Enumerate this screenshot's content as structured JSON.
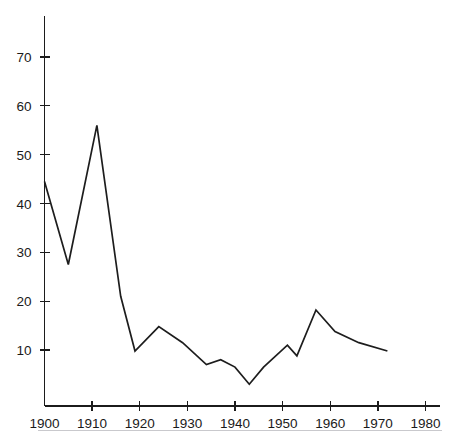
{
  "figure": {
    "clipped_header_text": "",
    "background_color": "#ffffff",
    "line_color": "#1d1d1d",
    "axis_color": "#1b1b1b",
    "rule_color": "#c9c9cd"
  },
  "chart_data": {
    "type": "line",
    "title": "",
    "subtitle": "",
    "xlabel": "",
    "ylabel": "",
    "xlim": [
      1900,
      1980
    ],
    "ylim": [
      0,
      78
    ],
    "grid": false,
    "legend": null,
    "x_ticks": [
      1900,
      1910,
      1920,
      1930,
      1940,
      1950,
      1960,
      1970,
      1980
    ],
    "x_tick_labels": [
      "1900",
      "1910",
      "1920",
      "1930",
      "1940",
      "1950",
      "1960",
      "1970",
      "1980"
    ],
    "y_ticks": [
      10,
      20,
      30,
      40,
      50,
      60,
      70
    ],
    "y_tick_labels": [
      "10",
      "20",
      "30",
      "40",
      "50",
      "60",
      "70"
    ],
    "series": [
      {
        "name": "series-1",
        "color": "#1d1d1d",
        "x": [
          1900,
          1905,
          1911,
          1916,
          1919,
          1924,
          1929,
          1934,
          1937,
          1940,
          1943,
          1946,
          1951,
          1953,
          1957,
          1961,
          1966,
          1972
        ],
        "values": [
          44.5,
          27.5,
          56.0,
          21.0,
          9.8,
          14.8,
          11.5,
          7.0,
          8.0,
          6.5,
          3.0,
          6.5,
          11.0,
          8.8,
          18.2,
          13.8,
          11.5,
          9.8
        ]
      }
    ],
    "annotations": []
  }
}
